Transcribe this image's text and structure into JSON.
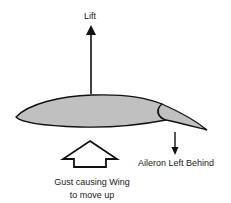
{
  "diagram": {
    "labels": {
      "lift": "Lift",
      "aileron": "Aileron Left Behind",
      "gust_line1": "Gust causing Wing",
      "gust_line2": "to move up"
    },
    "colors": {
      "wing_fill": "#c0c0c0",
      "outline": "#111111",
      "background": "#ffffff"
    }
  }
}
